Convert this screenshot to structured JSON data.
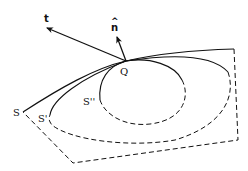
{
  "figure": {
    "labels": {
      "tangent": "t",
      "normal": "n",
      "normal_hat": "^",
      "point": "Q",
      "surface_outer": "S",
      "surface_middle": "S'",
      "surface_inner": "S''"
    },
    "colors": {
      "stroke": "#111111",
      "background": "#ffffff"
    }
  }
}
